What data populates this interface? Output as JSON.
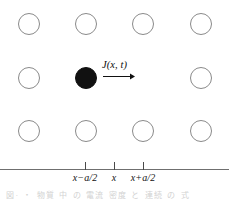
{
  "figure": {
    "background_color": "#ffffff",
    "lattice": {
      "rows": 3,
      "columns": 4,
      "column_x": [
        29,
        86,
        143,
        201
      ],
      "row_y": [
        24,
        78,
        131
      ],
      "radius": 11,
      "open_circle_color": "#8a8a8a",
      "filled_circle_color": "#111111",
      "sites": [
        {
          "row": 0,
          "col": 0,
          "state": "open"
        },
        {
          "row": 0,
          "col": 1,
          "state": "open"
        },
        {
          "row": 0,
          "col": 2,
          "state": "open"
        },
        {
          "row": 0,
          "col": 3,
          "state": "open"
        },
        {
          "row": 1,
          "col": 0,
          "state": "open"
        },
        {
          "row": 1,
          "col": 1,
          "state": "filled"
        },
        {
          "row": 1,
          "col": 2,
          "state": "hidden"
        },
        {
          "row": 1,
          "col": 3,
          "state": "open"
        },
        {
          "row": 2,
          "col": 0,
          "state": "open"
        },
        {
          "row": 2,
          "col": 1,
          "state": "open"
        },
        {
          "row": 2,
          "col": 2,
          "state": "open"
        },
        {
          "row": 2,
          "col": 3,
          "state": "open"
        }
      ]
    },
    "current": {
      "label": "J(x, t)",
      "label_x": 102,
      "label_y": 59,
      "arrow_direction": "right",
      "arrow_color": "#111111"
    },
    "axis": {
      "line_y": 169,
      "line_color": "#6f6f6f",
      "ticks": [
        {
          "x": 85,
          "label": "x−a/2"
        },
        {
          "x": 114,
          "label": "x"
        },
        {
          "x": 143,
          "label": "x+a/2"
        }
      ]
    },
    "caption": {
      "text": "図· ・ 物質 中 の 電流 密度 と 連続 の 式",
      "color": "#d2d2d2"
    }
  }
}
